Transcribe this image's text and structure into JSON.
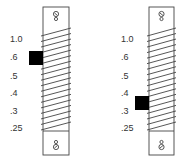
{
  "diagram": {
    "scale_labels": [
      "1.0",
      ".6",
      ".5",
      ".4",
      ".3",
      ".25"
    ],
    "gauges": [
      {
        "name": "left-gauge",
        "indicator_between": [
          ".6",
          ".5"
        ],
        "indicator_label_index": 1
      },
      {
        "name": "right-gauge",
        "indicator_between": [
          ".4",
          ".3"
        ],
        "indicator_label_index": 3.5
      }
    ],
    "colors": {
      "line": "#444444",
      "indicator": "#000000"
    }
  }
}
